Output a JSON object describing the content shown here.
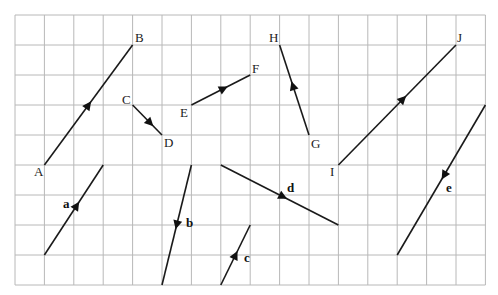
{
  "diagram": {
    "type": "vector-grid",
    "grid": {
      "origin_x": 15,
      "origin_y": 15,
      "cell_w": 29.4,
      "cell_h": 30,
      "cols": 16,
      "rows": 9,
      "line_color": "#b8b8b8"
    },
    "line_color": "#1a1a1a",
    "named_vectors": [
      {
        "id": "AB",
        "from": {
          "label": "A",
          "c": 1,
          "r": 5,
          "lx": 34,
          "ly": 176
        },
        "to": {
          "label": "B",
          "c": 4,
          "r": 1,
          "lx": 135,
          "ly": 42
        },
        "arrow_t": 0.5,
        "direction": "A-to-B"
      },
      {
        "id": "CD",
        "from": {
          "label": "C",
          "c": 4,
          "r": 3,
          "lx": 122,
          "ly": 104
        },
        "to": {
          "label": "D",
          "c": 5,
          "r": 4,
          "lx": 164,
          "ly": 147
        },
        "arrow_t": 0.6,
        "direction": "C-to-D"
      },
      {
        "id": "EF",
        "from": {
          "label": "E",
          "c": 6,
          "r": 3,
          "lx": 180,
          "ly": 117
        },
        "to": {
          "label": "F",
          "c": 8,
          "r": 2,
          "lx": 252,
          "ly": 73
        },
        "arrow_t": 0.55,
        "direction": "E-to-F"
      },
      {
        "id": "GH",
        "from": {
          "label": "G",
          "c": 10,
          "r": 4,
          "lx": 311,
          "ly": 148
        },
        "to": {
          "label": "H",
          "c": 9,
          "r": 1,
          "lx": 269,
          "ly": 42
        },
        "arrow_t": 0.55,
        "direction": "G-to-H"
      },
      {
        "id": "IJ",
        "from": {
          "label": "I",
          "c": 11,
          "r": 5,
          "lx": 330,
          "ly": 176
        },
        "to": {
          "label": "J",
          "c": 15,
          "r": 1,
          "lx": 457,
          "ly": 42
        },
        "arrow_t": 0.55,
        "direction": "I-to-J"
      }
    ],
    "free_vectors": [
      {
        "label": "a",
        "start": {
          "c": 1,
          "r": 8
        },
        "end": {
          "c": 3,
          "r": 5
        },
        "arrow_t": 0.55,
        "lx": 63,
        "ly": 208
      },
      {
        "label": "b",
        "start": {
          "c": 6,
          "r": 5
        },
        "end": {
          "c": 5,
          "r": 9
        },
        "arrow_t": 0.5,
        "lx": 186,
        "ly": 227
      },
      {
        "label": "c",
        "start": {
          "c": 7,
          "r": 9
        },
        "end": {
          "c": 8,
          "r": 7
        },
        "arrow_t": 0.5,
        "lx": 244,
        "ly": 262
      },
      {
        "label": "d",
        "start": {
          "c": 7,
          "r": 5
        },
        "end": {
          "c": 11,
          "r": 7
        },
        "arrow_t": 0.53,
        "lx": 287,
        "ly": 192
      },
      {
        "label": "e",
        "start": {
          "c": 16,
          "r": 3
        },
        "end": {
          "c": 13,
          "r": 8
        },
        "arrow_t": 0.47,
        "lx": 446,
        "ly": 192
      }
    ]
  }
}
